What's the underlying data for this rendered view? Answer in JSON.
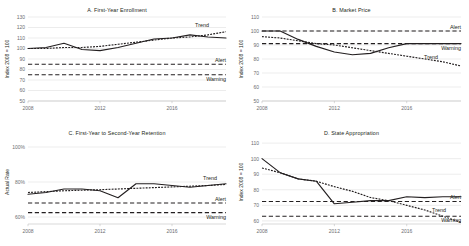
{
  "figure": {
    "background": "#ffffff",
    "ink": "#231f20",
    "gridline_color": "#d9d9d9",
    "tick_color": "#6d6e71"
  },
  "panels": [
    {
      "key": "panel-a",
      "title": "A. First-Year Enrollment",
      "ylabel": "Index 2008 = 100",
      "yticks": [
        "130",
        "120",
        "110",
        "100",
        "90",
        "80",
        "70",
        "60",
        "50"
      ],
      "ytick_values": [
        130,
        120,
        110,
        100,
        90,
        80,
        70,
        60,
        50
      ],
      "xticks": [
        "2008",
        "2012",
        "2016"
      ],
      "xtick_values": [
        2008,
        2012,
        2016
      ],
      "labels": {
        "trend": "Trend",
        "alert": "Alert",
        "warning": "Warning"
      },
      "alert_value": 85,
      "warning_value": 75
    },
    {
      "key": "panel-b",
      "title": "B. Market Price",
      "ylabel": "Index 2008 = 100",
      "yticks": [
        "110",
        "100",
        "90",
        "80",
        "70",
        "60",
        "50"
      ],
      "ytick_values": [
        110,
        100,
        90,
        80,
        70,
        60,
        50
      ],
      "xticks": [
        "2008",
        "2012",
        "2016"
      ],
      "xtick_values": [
        2008,
        2012,
        2016
      ],
      "labels": {
        "trend": "Trend",
        "alert": "Alert",
        "warning": "Warning"
      },
      "alert_value": 100,
      "warning_value": 91
    },
    {
      "key": "panel-c",
      "title": "C. First-Year to Second-Year Retention",
      "ylabel": "Actual Rate",
      "yticks": [
        "100%",
        "80%",
        "60%"
      ],
      "ytick_values": [
        100,
        80,
        60
      ],
      "xticks": [
        "2008",
        "2012",
        "2016"
      ],
      "xtick_values": [
        2008,
        2012,
        2016
      ],
      "labels": {
        "trend": "Trend",
        "alert": "Alert",
        "warning": "Warning"
      },
      "alert_value": 68,
      "warning_value": 62.5
    },
    {
      "key": "panel-d",
      "title": "D. State Appropriation",
      "ylabel": "Index 2008 = 100",
      "yticks": [
        "110",
        "100",
        "90",
        "80",
        "70",
        "60"
      ],
      "ytick_values": [
        110,
        100,
        90,
        80,
        70,
        60
      ],
      "xticks": [
        "2008",
        "2012",
        "2016"
      ],
      "xtick_values": [
        2008,
        2012,
        2016
      ],
      "labels": {
        "trend": "Trend",
        "alert": "Alert",
        "warning": "Warning"
      },
      "alert_value": 72.5,
      "warning_value": 63
    }
  ],
  "chart_data": [
    {
      "type": "line",
      "title": "A. First-Year Enrollment",
      "xlabel": "",
      "ylabel": "Index 2008 = 100",
      "ylim": [
        50,
        130
      ],
      "xlim": [
        2008,
        2019
      ],
      "grid": true,
      "legend_position": "inline-right",
      "annotations": [
        "Trend",
        "Alert",
        "Warning"
      ],
      "x": [
        2008,
        2009,
        2010,
        2011,
        2012,
        2013,
        2014,
        2015,
        2016,
        2017,
        2018,
        2019
      ],
      "series": [
        {
          "name": "Actual",
          "style": "solid",
          "values": [
            100,
            101,
            105,
            99,
            98,
            101,
            105,
            109,
            110,
            113,
            111,
            110
          ]
        },
        {
          "name": "Trend",
          "style": "dotted",
          "values": [
            100,
            100,
            101,
            101,
            102,
            104,
            106,
            108,
            110,
            111,
            113,
            116
          ]
        },
        {
          "name": "Alert",
          "style": "dashed-threshold",
          "values": [
            85,
            85,
            85,
            85,
            85,
            85,
            85,
            85,
            85,
            85,
            85,
            85
          ]
        },
        {
          "name": "Warning",
          "style": "dashed-threshold",
          "values": [
            75,
            75,
            75,
            75,
            75,
            75,
            75,
            75,
            75,
            75,
            75,
            75
          ]
        }
      ]
    },
    {
      "type": "line",
      "title": "B. Market Price",
      "xlabel": "",
      "ylabel": "Index 2008 = 100",
      "ylim": [
        50,
        110
      ],
      "xlim": [
        2008,
        2019
      ],
      "grid": true,
      "legend_position": "inline-right",
      "annotations": [
        "Trend",
        "Alert",
        "Warning"
      ],
      "x": [
        2008,
        2009,
        2010,
        2011,
        2012,
        2013,
        2014,
        2015,
        2016,
        2017,
        2018,
        2019
      ],
      "series": [
        {
          "name": "Actual",
          "style": "solid",
          "values": [
            100,
            100,
            94,
            89,
            85,
            83,
            84,
            88,
            91,
            91,
            91,
            91
          ]
        },
        {
          "name": "Trend",
          "style": "dotted",
          "values": [
            96,
            95,
            93,
            91,
            90,
            88,
            86,
            84,
            82,
            80,
            78,
            75
          ]
        },
        {
          "name": "Alert",
          "style": "dashed-threshold",
          "values": [
            100,
            100,
            100,
            100,
            100,
            100,
            100,
            100,
            100,
            100,
            100,
            100
          ]
        },
        {
          "name": "Warning",
          "style": "dashed-threshold",
          "values": [
            91,
            91,
            91,
            91,
            91,
            91,
            91,
            91,
            91,
            91,
            91,
            91
          ]
        }
      ]
    },
    {
      "type": "line",
      "title": "C. First-Year to Second-Year Retention",
      "xlabel": "",
      "ylabel": "Actual Rate",
      "ylim": [
        56,
        104
      ],
      "xlim": [
        2008,
        2019
      ],
      "grid": true,
      "legend_position": "inline-right",
      "annotations": [
        "Trend",
        "Alert",
        "Warning"
      ],
      "x": [
        2008,
        2009,
        2010,
        2011,
        2012,
        2013,
        2014,
        2015,
        2016,
        2017,
        2018,
        2019
      ],
      "series": [
        {
          "name": "Actual",
          "style": "solid",
          "values": [
            73,
            74,
            76,
            76,
            75,
            71,
            79,
            79,
            78,
            77,
            78,
            79
          ]
        },
        {
          "name": "Trend",
          "style": "dotted",
          "values": [
            74,
            74.5,
            75,
            75.3,
            75.6,
            76,
            76.4,
            76.8,
            77.2,
            77.6,
            78,
            78.6
          ]
        },
        {
          "name": "Alert",
          "style": "dashed-threshold",
          "values": [
            68,
            68,
            68,
            68,
            68,
            68,
            68,
            68,
            68,
            68,
            68,
            68
          ]
        },
        {
          "name": "Warning",
          "style": "dashed-threshold",
          "values": [
            62.5,
            62.5,
            62.5,
            62.5,
            62.5,
            62.5,
            62.5,
            62.5,
            62.5,
            62.5,
            62.5,
            62.5
          ]
        }
      ]
    },
    {
      "type": "line",
      "title": "D. State Appropriation",
      "xlabel": "",
      "ylabel": "Index 2008 = 100",
      "ylim": [
        58,
        112
      ],
      "xlim": [
        2008,
        2019
      ],
      "grid": true,
      "legend_position": "inline-right",
      "annotations": [
        "Trend",
        "Alert",
        "Warning"
      ],
      "x": [
        2008,
        2009,
        2010,
        2011,
        2012,
        2013,
        2014,
        2015,
        2016,
        2017,
        2018,
        2019
      ],
      "series": [
        {
          "name": "Actual",
          "style": "solid",
          "values": [
            100,
            91,
            87,
            85.5,
            71,
            72,
            73,
            73,
            75.5,
            75,
            75.5,
            75.5
          ]
        },
        {
          "name": "Trend",
          "style": "dotted",
          "values": [
            94,
            91,
            87,
            85.5,
            82,
            79,
            75,
            73,
            70,
            67,
            63,
            59
          ]
        },
        {
          "name": "Alert",
          "style": "dashed-threshold",
          "values": [
            72.5,
            72.5,
            72.5,
            72.5,
            72.5,
            72.5,
            72.5,
            72.5,
            72.5,
            72.5,
            72.5,
            72.5
          ]
        },
        {
          "name": "Warning",
          "style": "dashed-threshold",
          "values": [
            63,
            63,
            63,
            63,
            63,
            63,
            63,
            63,
            63,
            63,
            63,
            63
          ]
        }
      ]
    }
  ]
}
